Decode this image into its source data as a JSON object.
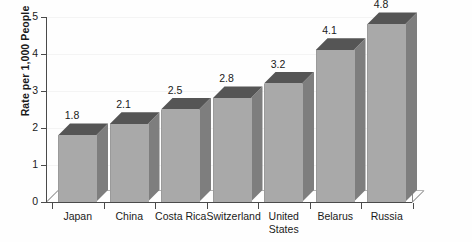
{
  "chart_data": {
    "type": "bar",
    "title": "",
    "subtitle": "",
    "xlabel": "",
    "ylabel": "Rate per 1,000 People",
    "categories": [
      "Japan",
      "China",
      "Costa Rica",
      "Switzerland",
      "United States",
      "Belarus",
      "Russia"
    ],
    "values": [
      1.8,
      2.1,
      2.5,
      2.8,
      3.2,
      4.1,
      4.8
    ],
    "data_labels": [
      "1.8",
      "2.1",
      "2.5",
      "2.8",
      "3.2",
      "4.1",
      "4.8"
    ],
    "ylim": [
      0,
      5
    ],
    "ytick_labels": [
      "0",
      "1",
      "2",
      "3",
      "4",
      "5"
    ],
    "ytick_values": [
      0,
      1,
      2,
      3,
      4,
      5
    ],
    "grid": true,
    "legend": null,
    "legend_position": "none",
    "style": "3d-column",
    "colors": {
      "bar_front": "#a9a9a9",
      "bar_top": "#555555",
      "bar_side": "#7e7e7e",
      "axis": "#4a4a4a",
      "gridline": "#f4f4f4",
      "text": "#1a1a1a",
      "background": "#fefefe"
    }
  }
}
